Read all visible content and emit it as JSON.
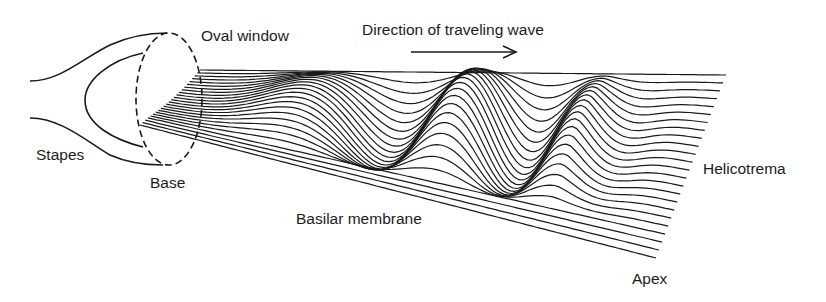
{
  "diagram": {
    "type": "cochlea-traveling-wave",
    "labels": {
      "oval_window": "Oval window",
      "direction": "Direction of traveling wave",
      "stapes": "Stapes",
      "base": "Base",
      "basilar_membrane": "Basilar membrane",
      "helicotrema": "Helicotrema",
      "apex": "Apex"
    },
    "line_color": "#1a1a1a",
    "membrane_line_count": 24
  }
}
